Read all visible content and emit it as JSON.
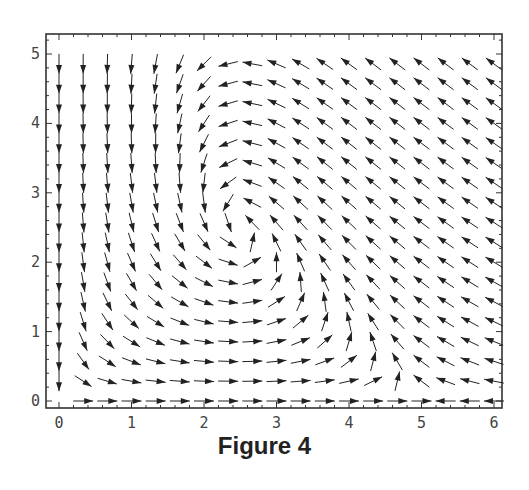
{
  "caption": "Figure 4",
  "chart_data": {
    "type": "vector_field",
    "title": "Figure 4",
    "xlabel": "",
    "ylabel": "",
    "xlim": [
      -0.15,
      6.15
    ],
    "ylim": [
      -0.1,
      5.25
    ],
    "x_ticks": [
      0,
      1,
      2,
      3,
      4,
      5,
      6
    ],
    "y_ticks": [
      0,
      1,
      2,
      3,
      4,
      5
    ],
    "grid": false,
    "arrow_grid": {
      "x_start": 0,
      "x_step": 0.3333,
      "x_count": 19,
      "y_start": 0,
      "y_step": 0.2857,
      "y_count": 18
    },
    "arrows_normalized": true,
    "field_description": "Predator-prey phase field: arrows point right along y=0 for x<5 and left for x>5; straight down along x=0; counter-clockwise circulation around an equilibrium near (2.5, 3).",
    "model": {
      "dx": "x*(1 - x/5) - 0.2*x*y",
      "dy": "y*(-1 + 0.4*x)*0.8"
    },
    "equilibria": [
      [
        0,
        0
      ],
      [
        5,
        0
      ],
      [
        2.5,
        2.5
      ]
    ]
  },
  "colors": {
    "arrow": "#222222",
    "axis": "#333333",
    "background": "#ffffff"
  }
}
